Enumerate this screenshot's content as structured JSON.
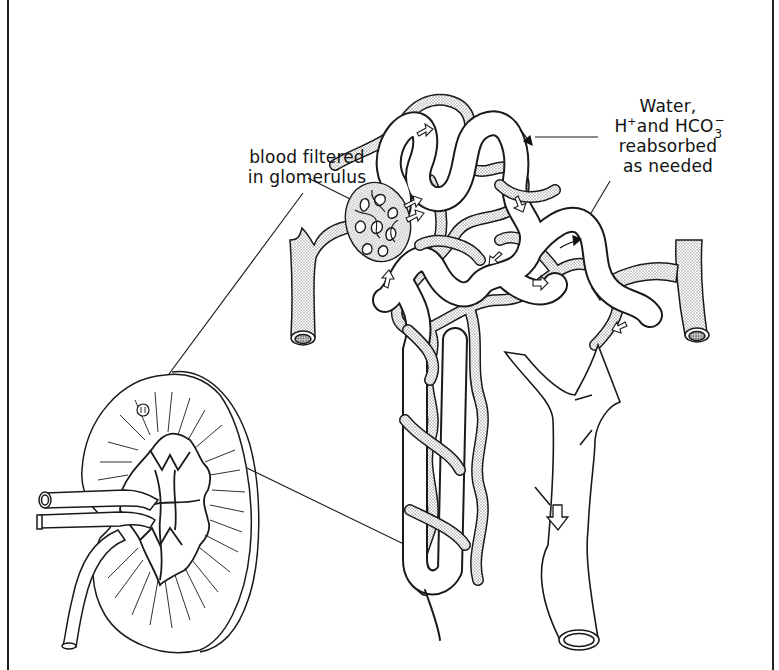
{
  "figure": {
    "type": "anatomical line drawing",
    "colors": {
      "ink": "#1a1a1a",
      "stipple": "#9a9a9a",
      "background": "#ffffff"
    }
  },
  "labels": {
    "glomerulus": {
      "line1": "blood filtered",
      "line2": "in glomerulus"
    },
    "reabsorption": {
      "line1": "Water,",
      "line2_prefix": "H",
      "line2_sup": "+",
      "line2_middle": " and HCO",
      "line2_sub": "3",
      "line2_sub_sup": "−",
      "line3": "reabsorbed",
      "line4": "as needed"
    }
  },
  "parts": [
    {
      "name": "kidney-cross-section"
    },
    {
      "name": "renal-artery-and-vein"
    },
    {
      "name": "ureter"
    },
    {
      "name": "glomerulus"
    },
    {
      "name": "afferent-vessel"
    },
    {
      "name": "efferent-vessel"
    },
    {
      "name": "convoluted-tubules"
    },
    {
      "name": "loop-of-henle"
    },
    {
      "name": "collecting-duct"
    },
    {
      "name": "flow-arrows"
    }
  ]
}
